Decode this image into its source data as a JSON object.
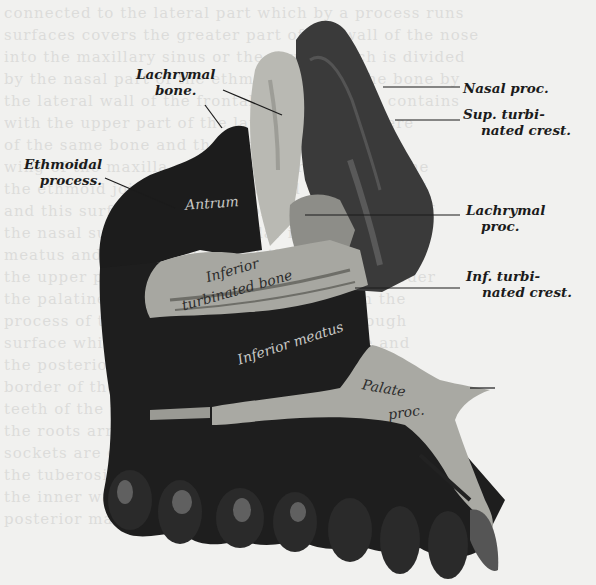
{
  "figure": {
    "background_color": "#f1f1ef",
    "ink_color": "#1b1b1b"
  },
  "labels": {
    "lachrymal_bone": [
      "Lachrymal",
      "bone."
    ],
    "ethmoidal_process": [
      "Ethmoidal",
      "process."
    ],
    "nasal_proc": [
      "Nasal proc."
    ],
    "sup_turbinated_crest": [
      "Sup. turbi-",
      "nated crest."
    ],
    "lachrymal_proc": [
      "Lachrymal",
      "proc."
    ],
    "inf_turbinated_crest": [
      "Inf. turbi-",
      "nated crest."
    ]
  },
  "inline_labels": {
    "antrum": "Antrum",
    "inferior_turbinated_bone_1": "Inferior",
    "inferior_turbinated_bone_2": "turbinated bone",
    "inferior_meatus": "Inferior meatus",
    "palate_proc_1": "Palate",
    "palate_proc_2": "proc."
  }
}
